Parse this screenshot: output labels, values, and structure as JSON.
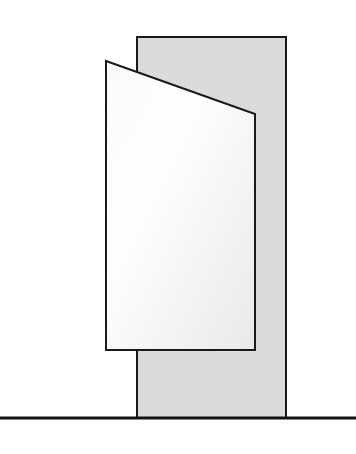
{
  "diagram": {
    "colors": {
      "background": "#ffffff",
      "stroke": "#1a1a1a",
      "back_panel_fill": "#e2e2e2",
      "back_panel_dither": "#cfcfcf",
      "front_panel_fill_start": "#ffffff",
      "front_panel_fill_end": "#ececec"
    },
    "ground_line": {
      "x1": 0,
      "x2": 356,
      "y": 418,
      "stroke_width": 3
    },
    "back_panel": {
      "x": 137,
      "y": 37,
      "width": 149,
      "height": 381
    },
    "front_panel": {
      "points": [
        [
          106,
          61
        ],
        [
          255,
          114
        ],
        [
          255,
          350
        ],
        [
          106,
          350
        ]
      ]
    }
  }
}
